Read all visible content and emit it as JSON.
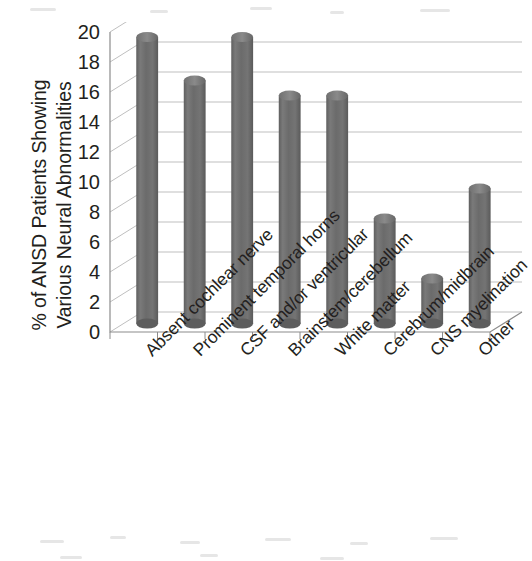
{
  "chart_data": {
    "type": "bar",
    "title": "",
    "subtitle": "",
    "xlabel": "",
    "ylabel": "% of ANSD Patients Showing Various Neural Abnormalities",
    "ylabel_lines": [
      "% of ANSD Patients Showing",
      "Various Neural Abnormalities"
    ],
    "categories": [
      "Absent cochlear nerve",
      "Prominent temporal horns",
      "CSF and/or ventricular",
      "Brainstem/cerebellum",
      "White matter",
      "Cerebrum/midbrain",
      "CNS myelination",
      "Other"
    ],
    "values": [
      19.1,
      16.2,
      19.1,
      15.2,
      15.2,
      7.0,
      3.0,
      9.0
    ],
    "ylim": [
      0,
      20
    ],
    "ytick_step": 2,
    "yticks": [
      20,
      18,
      16,
      14,
      12,
      10,
      8,
      6,
      4,
      2,
      0
    ],
    "ytick_labels": [
      "20",
      "18",
      "16",
      "14",
      "12",
      "10",
      "8",
      "6",
      "4",
      "2",
      "0"
    ],
    "grid": true,
    "grid_axis": "y",
    "legend": false,
    "legend_position": "none",
    "style": "3d-cylinder",
    "bar_color": "#6e6e6e",
    "bar_edge_color": "#555555",
    "grid_color": "#bfbfbf",
    "axis_color": "#8c8c8c",
    "text_color": "#231f20",
    "background_color": "#ffffff"
  }
}
